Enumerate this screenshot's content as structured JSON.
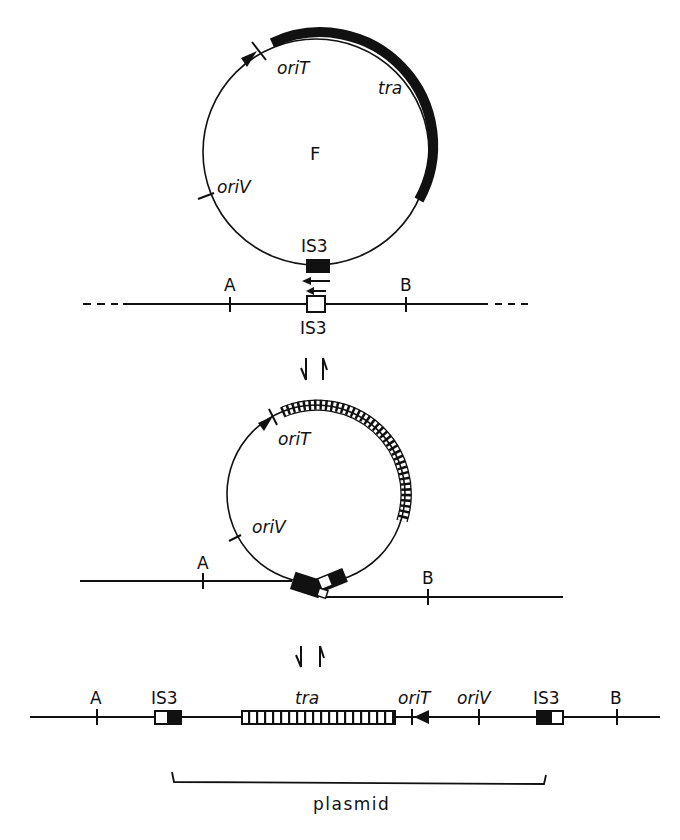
{
  "figure": {
    "type": "F-plasmid integration into chromosome via IS3 recombination",
    "colors": {
      "ink": "#111111",
      "background": "#ffffff"
    }
  },
  "panel_top": {
    "circle_label": "F",
    "oriT_label": "oriT",
    "tra_label": "tra",
    "oriV_label": "oriV",
    "plasmid_is_label": "IS3",
    "chromosome_is_label": "IS3",
    "marker_a": "A",
    "marker_b": "B"
  },
  "arrows_1": {
    "forward": "down-arrow",
    "reverse": "up-arrow"
  },
  "panel_middle": {
    "oriT_label": "oriT",
    "oriV_label": "oriV",
    "marker_a": "A",
    "marker_b": "B"
  },
  "arrows_2": {
    "forward": "down-arrow",
    "reverse": "up-arrow"
  },
  "panel_bottom": {
    "marker_a": "A",
    "is3_left": "IS3",
    "tra_label": "tra",
    "oriT_label": "oriT",
    "oriV_label": "oriV",
    "is3_right": "IS3",
    "marker_b": "B",
    "bracket_label": "plasmid"
  }
}
